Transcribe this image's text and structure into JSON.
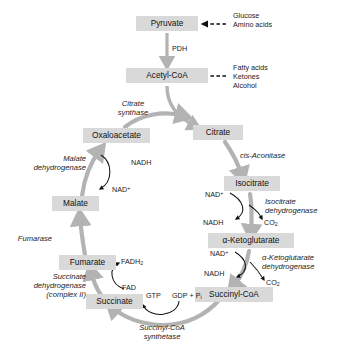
{
  "figure": {
    "caption": ""
  },
  "colors": {
    "box_fill": "#d9d9d9",
    "arrow_gray": "#b3b3b3",
    "text": "#1a1a1a",
    "thin_arrow": "#111111"
  },
  "metabolites": [
    {
      "id": "pyruvate",
      "label": "Pyruvate"
    },
    {
      "id": "acetyl_coa",
      "label": "Acetyl-CoA"
    },
    {
      "id": "citrate",
      "label": "Citrate"
    },
    {
      "id": "isocitrate",
      "label": "Isocitrate"
    },
    {
      "id": "alpha_kg",
      "label": "α-Ketoglutarate"
    },
    {
      "id": "succinyl_coa",
      "label": "Succinyl-CoA"
    },
    {
      "id": "succinate",
      "label": "Succinate"
    },
    {
      "id": "fumarate",
      "label": "Fumarate"
    },
    {
      "id": "malate",
      "label": "Malate"
    },
    {
      "id": "oxaloacetate",
      "label": "Oxaloacetate"
    }
  ],
  "enzymes": [
    {
      "id": "pdh",
      "label": "PDH",
      "italic": false
    },
    {
      "id": "citrate_syn",
      "line1": "Citrate",
      "line2": "synthase"
    },
    {
      "id": "cis_aconitase",
      "label": "cis-Aconitase"
    },
    {
      "id": "icdh",
      "line1": "Isocitrate",
      "line2": "dehydrogenase"
    },
    {
      "id": "akgdh",
      "line1": "α-Ketoglutarate",
      "line2": "dehydrogenase"
    },
    {
      "id": "scs",
      "line1": "Succinyl-CoA",
      "line2": "synthetase"
    },
    {
      "id": "sdh",
      "line1": "Succinate",
      "line2": "dehydrogenase",
      "line3": "(complex II)"
    },
    {
      "id": "fumarase",
      "label": "Fumarase"
    },
    {
      "id": "mdh",
      "line1": "Malate",
      "line2": "dehydrogenase"
    }
  ],
  "inputs": {
    "to_pyruvate": [
      "Glucose",
      "Amino acids"
    ],
    "to_acetyl_coa": [
      "Fatty acids",
      "Ketones",
      "Alcohol"
    ]
  },
  "cofactors": {
    "mdh_in": "NAD",
    "mdh_in_sup": "+",
    "mdh_out": "NADH",
    "icdh_in": "NAD",
    "icdh_in_sup": "+",
    "icdh_out": "NADH",
    "icdh_co2": "CO",
    "icdh_co2_sub": "2",
    "akgdh_in": "NAD",
    "akgdh_in_sup": "+",
    "akgdh_out": "NADH",
    "akgdh_co2": "CO",
    "akgdh_co2_sub": "2",
    "sdh_in": "FAD",
    "sdh_out": "FADH",
    "sdh_out_sub": "2",
    "scs_in": "GDP + P",
    "scs_in_sub": "i",
    "scs_out": "GTP"
  }
}
